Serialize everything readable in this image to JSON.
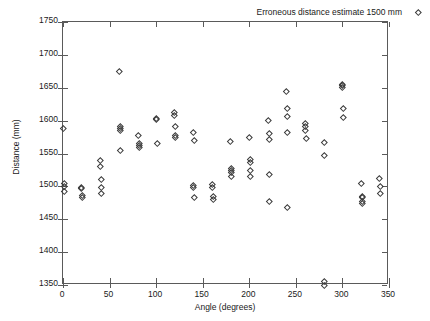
{
  "chart_data": {
    "type": "scatter",
    "title": "",
    "xlabel": "Angle (degrees)",
    "ylabel": "Distance (mm)",
    "xlim": [
      0,
      350
    ],
    "ylim": [
      1350,
      1750
    ],
    "xticks": [
      0,
      50,
      100,
      150,
      200,
      250,
      300,
      350
    ],
    "yticks": [
      1350,
      1400,
      1450,
      1500,
      1550,
      1600,
      1650,
      1700,
      1750
    ],
    "grid": false,
    "legend_position": "top-right",
    "marker": "open-diamond",
    "marker_color": "#3a3a3a",
    "series": [
      {
        "name": "Erroneous distance estimate 1500 mm",
        "points": [
          [
            0,
            1588
          ],
          [
            1,
            1505
          ],
          [
            1,
            1500
          ],
          [
            1,
            1493
          ],
          [
            20,
            1498
          ],
          [
            20,
            1497
          ],
          [
            21,
            1487
          ],
          [
            21,
            1483
          ],
          [
            40,
            1540
          ],
          [
            40,
            1531
          ],
          [
            41,
            1511
          ],
          [
            41,
            1499
          ],
          [
            41,
            1490
          ],
          [
            60,
            1675
          ],
          [
            61,
            1592
          ],
          [
            61,
            1589
          ],
          [
            61,
            1586
          ],
          [
            61,
            1555
          ],
          [
            81,
            1577
          ],
          [
            82,
            1566
          ],
          [
            82,
            1563
          ],
          [
            82,
            1560
          ],
          [
            100,
            1603
          ],
          [
            100,
            1602
          ],
          [
            101,
            1565
          ],
          [
            120,
            1613
          ],
          [
            120,
            1608
          ],
          [
            121,
            1591
          ],
          [
            121,
            1578
          ],
          [
            121,
            1574
          ],
          [
            140,
            1583
          ],
          [
            141,
            1570
          ],
          [
            140,
            1502
          ],
          [
            140,
            1498
          ],
          [
            141,
            1484
          ],
          [
            160,
            1503
          ],
          [
            160,
            1498
          ],
          [
            161,
            1485
          ],
          [
            161,
            1481
          ],
          [
            180,
            1569
          ],
          [
            181,
            1527
          ],
          [
            181,
            1525
          ],
          [
            181,
            1521
          ],
          [
            181,
            1516
          ],
          [
            200,
            1574
          ],
          [
            201,
            1541
          ],
          [
            201,
            1536
          ],
          [
            201,
            1524
          ],
          [
            201,
            1515
          ],
          [
            220,
            1601
          ],
          [
            221,
            1581
          ],
          [
            221,
            1571
          ],
          [
            222,
            1519
          ],
          [
            221,
            1477
          ],
          [
            240,
            1645
          ],
          [
            241,
            1619
          ],
          [
            241,
            1607
          ],
          [
            241,
            1583
          ],
          [
            241,
            1468
          ],
          [
            260,
            1596
          ],
          [
            260,
            1591
          ],
          [
            260,
            1586
          ],
          [
            261,
            1573
          ],
          [
            280,
            1567
          ],
          [
            280,
            1547
          ],
          [
            280,
            1356
          ],
          [
            280,
            1350
          ],
          [
            300,
            1655
          ],
          [
            300,
            1653
          ],
          [
            300,
            1651
          ],
          [
            301,
            1619
          ],
          [
            301,
            1605
          ],
          [
            320,
            1505
          ],
          [
            321,
            1485
          ],
          [
            321,
            1483
          ],
          [
            321,
            1477
          ],
          [
            321,
            1474
          ],
          [
            340,
            1512
          ],
          [
            341,
            1500
          ],
          [
            341,
            1489
          ]
        ]
      }
    ]
  },
  "legend": {
    "label": "Erroneous distance estimate 1500 mm"
  },
  "axes": {
    "x_title": "Angle (degrees)",
    "y_title": "Distance (mm)",
    "x_tick_labels": [
      "0",
      "50",
      "100",
      "150",
      "200",
      "250",
      "300",
      "350"
    ],
    "y_tick_labels": [
      "1350",
      "1400",
      "1450",
      "1500",
      "1550",
      "1600",
      "1650",
      "1700",
      "1750"
    ]
  }
}
